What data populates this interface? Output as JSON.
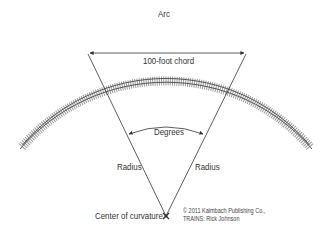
{
  "diagram": {
    "labels": {
      "arc": "Arc",
      "chord": "100-foot chord",
      "degrees": "Degrees",
      "radius_left": "Radius",
      "radius_right": "Radius",
      "center": "Center of curvature"
    },
    "credit": {
      "line1": "© 2011 Kalmbach Publishing Co.,",
      "line2": "TRAINS: Rick Johnson"
    },
    "colors": {
      "track": "#8c8c8c",
      "rail": "#555555",
      "line": "#333333",
      "text": "#333333",
      "background": "#ffffff"
    }
  }
}
